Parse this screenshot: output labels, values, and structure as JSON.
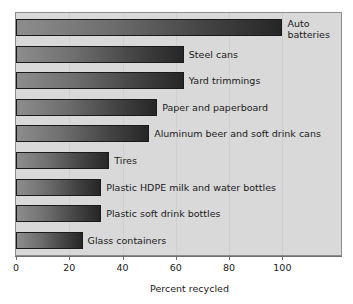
{
  "chart_data": {
    "type": "bar",
    "orientation": "horizontal",
    "title": "",
    "xlabel": "Percent recycled",
    "ylabel": "",
    "xlim": [
      0,
      122
    ],
    "ylim": [
      0,
      9
    ],
    "grid": true,
    "legend": false,
    "xticks": [
      0,
      20,
      40,
      60,
      80,
      100
    ],
    "xticklabels": [
      "0",
      "20",
      "40",
      "60",
      "80",
      "100"
    ],
    "categories": [
      "Auto batteries",
      "Steel cans",
      "Yard trimmings",
      "Paper and paperboard",
      "Aluminum beer and soft drink cans",
      "Tires",
      "Plastic HDPE milk and water bottles",
      "Plastic soft drink bottles",
      "Glass containers"
    ],
    "values": [
      100,
      63,
      63,
      53,
      50,
      35,
      32,
      32,
      25
    ],
    "bars": [
      {
        "label": "Auto batteries",
        "label_lines": [
          "Auto",
          "batteries"
        ],
        "value": 100
      },
      {
        "label": "Steel cans",
        "label_lines": [
          "Steel cans"
        ],
        "value": 63
      },
      {
        "label": "Yard trimmings",
        "label_lines": [
          "Yard trimmings"
        ],
        "value": 63
      },
      {
        "label": "Paper and paperboard",
        "label_lines": [
          "Paper and paperboard"
        ],
        "value": 53
      },
      {
        "label": "Aluminum beer and soft drink cans",
        "label_lines": [
          "Aluminum beer and soft drink cans"
        ],
        "value": 50
      },
      {
        "label": "Tires",
        "label_lines": [
          "Tires"
        ],
        "value": 35
      },
      {
        "label": "Plastic HDPE milk and water bottles",
        "label_lines": [
          "Plastic HDPE milk and water bottles"
        ],
        "value": 32
      },
      {
        "label": "Plastic soft drink bottles",
        "label_lines": [
          "Plastic soft drink bottles"
        ],
        "value": 32
      },
      {
        "label": "Glass containers",
        "label_lines": [
          "Glass containers"
        ],
        "value": 25
      }
    ],
    "colors": {
      "plot_background": "#d9d9d9",
      "figure_background": "#ffffff",
      "bar_gradient_start": "#8d8d8d",
      "bar_gradient_end": "#262626",
      "bar_edge": "#1a1a1a",
      "grid": "#cfcfcf",
      "axis": "#6f6f6f",
      "text": "#1a1a1a"
    }
  }
}
